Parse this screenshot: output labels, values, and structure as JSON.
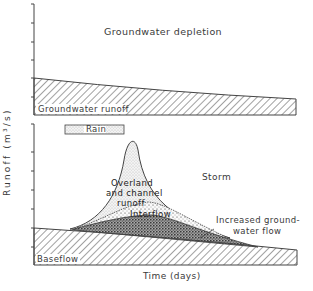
{
  "diagram": {
    "top_panel": {
      "title": "Groundwater depletion",
      "band_label": "Groundwater runoff"
    },
    "bottom_panel": {
      "title": "Storm",
      "rain_label": "Rain",
      "labels": {
        "overland_line1": "Overland",
        "overland_line2": "and channel",
        "overland_line3": "runoff",
        "interflow": "Interflow",
        "groundwater_line1": "Increased ground-",
        "groundwater_line2": "water flow",
        "baseflow": "Baseflow"
      }
    },
    "axes": {
      "ylabel": "Runoff (m³/s)",
      "xlabel": "Time (days)"
    },
    "colors": {
      "ink": "#3a3a3a",
      "background": "#ffffff"
    }
  }
}
